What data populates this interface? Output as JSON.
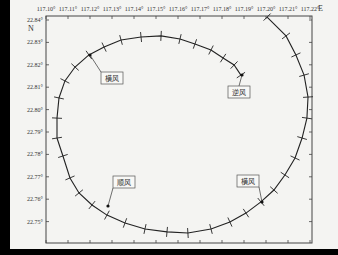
{
  "chart_data": {
    "type": "line",
    "title": "",
    "xlabel": "E",
    "ylabel": "N",
    "x_ticks": [
      "117.10°",
      "117.11°",
      "117.12°",
      "117.13°",
      "117.14°",
      "117.15°",
      "117.16°",
      "117.17°",
      "117.18°",
      "117.19°",
      "117.20°",
      "117.21°",
      "117.22°"
    ],
    "y_ticks": [
      "22.84°",
      "22.83°",
      "22.82°",
      "22.81°",
      "22.80°",
      "22.79°",
      "22.78°",
      "22.77°",
      "22.76°",
      "22.75°"
    ],
    "xlim": [
      117.1,
      117.221
    ],
    "ylim": [
      22.7465,
      22.8413
    ],
    "grid": false,
    "legend": "none",
    "series": [
      {
        "name": "trajectory",
        "marker": "+",
        "points": [
          [
            117.2005,
            22.8413
          ],
          [
            117.2091,
            22.8329
          ],
          [
            117.2136,
            22.8244
          ],
          [
            117.2173,
            22.8154
          ],
          [
            117.2191,
            22.8056
          ],
          [
            117.2186,
            22.7962
          ],
          [
            117.2164,
            22.7873
          ],
          [
            117.2132,
            22.7784
          ],
          [
            117.2086,
            22.7708
          ],
          [
            117.2036,
            22.7641
          ],
          [
            117.1977,
            22.7588
          ],
          [
            117.1909,
            22.7538
          ],
          [
            117.1836,
            22.7498
          ],
          [
            117.175,
            22.7467
          ],
          [
            117.1645,
            22.7449
          ],
          [
            117.155,
            22.7454
          ],
          [
            117.145,
            22.7467
          ],
          [
            117.1359,
            22.7494
          ],
          [
            117.1277,
            22.7529
          ],
          [
            117.1209,
            22.7574
          ],
          [
            117.115,
            22.7628
          ],
          [
            117.1109,
            22.7695
          ],
          [
            117.1077,
            22.7793
          ],
          [
            117.105,
            22.7873
          ],
          [
            117.105,
            22.7962
          ],
          [
            117.1059,
            22.8052
          ],
          [
            117.1086,
            22.8128
          ],
          [
            117.1132,
            22.819
          ],
          [
            117.1195,
            22.8244
          ],
          [
            117.1264,
            22.8279
          ],
          [
            117.1341,
            22.8311
          ],
          [
            117.1432,
            22.8324
          ],
          [
            117.1523,
            22.8329
          ],
          [
            117.1609,
            22.8315
          ],
          [
            117.1677,
            22.8293
          ],
          [
            117.175,
            22.8266
          ],
          [
            117.1805,
            22.823
          ],
          [
            117.1855,
            22.8199
          ],
          [
            117.1886,
            22.8154
          ]
        ]
      }
    ],
    "annotations": [
      {
        "text": "横风",
        "at": [
          117.1132,
          22.819
        ]
      },
      {
        "text": "逆风",
        "at": [
          117.1886,
          22.8154
        ]
      },
      {
        "text": "顺风",
        "at": [
          117.1209,
          22.7574
        ]
      },
      {
        "text": "横风",
        "at": [
          117.2036,
          22.7641
        ]
      }
    ]
  },
  "axes": {
    "x_unit_label": "E",
    "y_unit_label": "N"
  },
  "callouts": {
    "top_left": "横风",
    "right": "逆风",
    "bottom_left": "顺风",
    "bottom_right": "横风"
  }
}
